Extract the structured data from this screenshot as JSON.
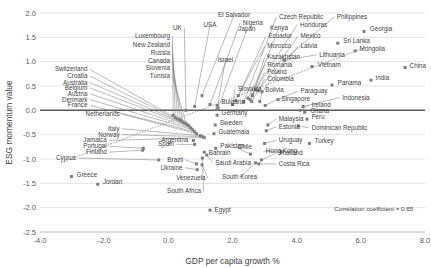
{
  "chart_data": {
    "type": "scatter",
    "title": "",
    "xlabel": "GDP per capita growth %",
    "ylabel": "ESG momentum value",
    "xlim": [
      -4.0,
      8.0
    ],
    "ylim": [
      -2.5,
      2.0
    ],
    "xticks": [
      "-4.0",
      "-2.0",
      "0.0",
      "2.0",
      "4.0",
      "6.0",
      "8.0"
    ],
    "xtick_values": [
      -4.0,
      -2.0,
      0.0,
      2.0,
      4.0,
      6.0,
      8.0
    ],
    "yticks": [
      "2.0",
      "1.5",
      "1.0",
      "0.5",
      "0.0",
      "-0.5",
      "-1.0",
      "-1.5",
      "-2.0",
      "-2.5"
    ],
    "ytick_values": [
      2.0,
      1.5,
      1.0,
      0.5,
      0.0,
      -0.5,
      -1.0,
      -1.5,
      -2.0,
      -2.5
    ],
    "grid": true,
    "legend": "none",
    "annotations": [
      {
        "text": "Correlation  coefficient = 0.65",
        "x": 6.4,
        "y": -2.07
      }
    ],
    "trendline": {
      "visible": true,
      "style": "dotted",
      "x0": -3.35,
      "y0": -1.08,
      "x1": 6.25,
      "y1": 1.32
    },
    "marker_color": "#808080",
    "points": [
      {
        "name": "El Salvador",
        "x": 1.05,
        "y": 0.3,
        "lx": 2.05,
        "ly": 1.92,
        "anchor": "middle"
      },
      {
        "name": "USA",
        "x": 0.82,
        "y": 0.08,
        "lx": 1.3,
        "ly": 1.72,
        "anchor": "middle"
      },
      {
        "name": "Nigeria",
        "x": 1.3,
        "y": 0.12,
        "lx": 2.32,
        "ly": 1.76,
        "anchor": "start"
      },
      {
        "name": "UK",
        "x": 0.55,
        "y": 0.0,
        "lx": 0.42,
        "ly": 1.66,
        "anchor": "end"
      },
      {
        "name": "Japan",
        "x": 1.55,
        "y": 0.05,
        "lx": 2.45,
        "ly": 1.62,
        "anchor": "middle"
      },
      {
        "name": "Czech Republic",
        "x": 2.35,
        "y": 0.18,
        "lx": 3.45,
        "ly": 1.88,
        "anchor": "start"
      },
      {
        "name": "Kenya",
        "x": 2.62,
        "y": 0.32,
        "lx": 3.45,
        "ly": 1.66,
        "anchor": "middle"
      },
      {
        "name": "Honduras",
        "x": 2.72,
        "y": 0.42,
        "lx": 4.1,
        "ly": 1.72,
        "anchor": "start"
      },
      {
        "name": "Philippines",
        "x": 3.6,
        "y": 1.03,
        "lx": 5.25,
        "ly": 1.88,
        "anchor": "start"
      },
      {
        "name": "Georgia",
        "x": 6.1,
        "y": 1.62,
        "lx": 6.28,
        "ly": 1.62,
        "anchor": "start"
      },
      {
        "name": "Luxembourg",
        "x": 0.15,
        "y": -0.1,
        "lx": 0.05,
        "ly": 1.48,
        "anchor": "end"
      },
      {
        "name": "Ecuador",
        "x": 2.18,
        "y": 0.3,
        "lx": 3.12,
        "ly": 1.48,
        "anchor": "start"
      },
      {
        "name": "Mexico",
        "x": 2.8,
        "y": 0.4,
        "lx": 4.12,
        "ly": 1.48,
        "anchor": "start"
      },
      {
        "name": "Sri Lanka",
        "x": 5.28,
        "y": 1.38,
        "lx": 5.45,
        "ly": 1.38,
        "anchor": "start"
      },
      {
        "name": "New Zealand",
        "x": 0.22,
        "y": -0.15,
        "lx": 0.05,
        "ly": 1.3,
        "anchor": "end"
      },
      {
        "name": "Morocco",
        "x": 2.1,
        "y": 0.2,
        "lx": 3.08,
        "ly": 1.28,
        "anchor": "start"
      },
      {
        "name": "Latvia",
        "x": 2.92,
        "y": 0.38,
        "lx": 4.12,
        "ly": 1.28,
        "anchor": "start"
      },
      {
        "name": "Lithuania",
        "x": 3.62,
        "y": 1.03,
        "lx": 4.7,
        "ly": 1.1,
        "anchor": "start"
      },
      {
        "name": "Mongolia",
        "x": 5.82,
        "y": 1.22,
        "lx": 5.96,
        "ly": 1.22,
        "anchor": "start"
      },
      {
        "name": "Russia",
        "x": 0.3,
        "y": -0.18,
        "lx": 0.05,
        "ly": 1.14,
        "anchor": "end"
      },
      {
        "name": "Kazakhstan",
        "x": 2.62,
        "y": 0.3,
        "lx": 3.08,
        "ly": 1.05,
        "anchor": "start"
      },
      {
        "name": "Israel",
        "x": 1.52,
        "y": 0.02,
        "lx": 1.78,
        "ly": 1.0,
        "anchor": "middle"
      },
      {
        "name": "Romania",
        "x": 2.48,
        "y": 0.25,
        "lx": 3.08,
        "ly": 0.89,
        "anchor": "start"
      },
      {
        "name": "Vietnam",
        "x": 4.48,
        "y": 0.9,
        "lx": 4.66,
        "ly": 0.9,
        "anchor": "start"
      },
      {
        "name": "China",
        "x": 7.38,
        "y": 0.88,
        "lx": 7.52,
        "ly": 0.88,
        "anchor": "start"
      },
      {
        "name": "Canada",
        "x": 0.38,
        "y": -0.2,
        "lx": 0.05,
        "ly": 0.98,
        "anchor": "end"
      },
      {
        "name": "Switzerland",
        "x": 0.4,
        "y": -0.22,
        "lx": -2.52,
        "ly": 0.8,
        "anchor": "end"
      },
      {
        "name": "Slovenia",
        "x": 0.46,
        "y": -0.24,
        "lx": 0.05,
        "ly": 0.82,
        "anchor": "end"
      },
      {
        "name": "Poland",
        "x": 2.55,
        "y": 0.22,
        "lx": 3.08,
        "ly": 0.74,
        "anchor": "start"
      },
      {
        "name": "Croatia",
        "x": 0.5,
        "y": -0.26,
        "lx": -2.52,
        "ly": 0.66,
        "anchor": "end"
      },
      {
        "name": "Tunisia",
        "x": 0.56,
        "y": -0.28,
        "lx": 0.05,
        "ly": 0.66,
        "anchor": "end"
      },
      {
        "name": "Colombia",
        "x": 2.6,
        "y": 0.18,
        "lx": 3.08,
        "ly": 0.6,
        "anchor": "start"
      },
      {
        "name": "India",
        "x": 6.32,
        "y": 0.62,
        "lx": 6.46,
        "ly": 0.62,
        "anchor": "start"
      },
      {
        "name": "Australia",
        "x": 0.6,
        "y": -0.3,
        "lx": -2.52,
        "ly": 0.53,
        "anchor": "end"
      },
      {
        "name": "Belgium",
        "x": 0.64,
        "y": -0.32,
        "lx": -2.52,
        "ly": 0.42,
        "anchor": "end"
      },
      {
        "name": "Slovakia",
        "x": 2.0,
        "y": 0.12,
        "lx": 2.16,
        "ly": 0.4,
        "anchor": "start"
      },
      {
        "name": "Bolivia",
        "x": 2.85,
        "y": 0.18,
        "lx": 3.02,
        "ly": 0.38,
        "anchor": "start"
      },
      {
        "name": "Paraguay",
        "x": 3.42,
        "y": 0.22,
        "lx": 4.12,
        "ly": 0.36,
        "anchor": "start"
      },
      {
        "name": "Panama",
        "x": 5.1,
        "y": 0.52,
        "lx": 5.28,
        "ly": 0.52,
        "anchor": "start"
      },
      {
        "name": "Austria",
        "x": 0.7,
        "y": -0.36,
        "lx": -2.52,
        "ly": 0.3,
        "anchor": "end"
      },
      {
        "name": "Singapore",
        "x": 3.02,
        "y": 0.1,
        "lx": 3.52,
        "ly": 0.2,
        "anchor": "start"
      },
      {
        "name": "Indonesia",
        "x": 4.2,
        "y": 0.08,
        "lx": 5.42,
        "ly": 0.22,
        "anchor": "start"
      },
      {
        "name": "Denmark",
        "x": 0.76,
        "y": -0.4,
        "lx": -2.52,
        "ly": 0.18,
        "anchor": "end"
      },
      {
        "name": "Bulgaria",
        "x": 1.52,
        "y": 0.1,
        "lx": 1.66,
        "ly": 0.12,
        "anchor": "start"
      },
      {
        "name": "Ireland",
        "x": 4.1,
        "y": 0.0,
        "lx": 4.46,
        "ly": 0.06,
        "anchor": "start"
      },
      {
        "name": "France",
        "x": 0.82,
        "y": -0.44,
        "lx": -2.52,
        "ly": 0.06,
        "anchor": "end"
      },
      {
        "name": "Netherlands",
        "x": 0.88,
        "y": -0.48,
        "lx": -1.52,
        "ly": -0.12,
        "anchor": "end"
      },
      {
        "name": "Germany",
        "x": 1.52,
        "y": -0.1,
        "lx": 1.66,
        "ly": -0.1,
        "anchor": "start"
      },
      {
        "name": "Ghana",
        "x": 4.25,
        "y": -0.04,
        "lx": 4.42,
        "ly": -0.06,
        "anchor": "start"
      },
      {
        "name": "Peru",
        "x": 4.32,
        "y": -0.18,
        "lx": 4.46,
        "ly": -0.18,
        "anchor": "start"
      },
      {
        "name": "Malaysia",
        "x": 3.1,
        "y": -0.3,
        "lx": 3.44,
        "ly": -0.22,
        "anchor": "start"
      },
      {
        "name": "Italy",
        "x": 1.0,
        "y": -0.52,
        "lx": -1.52,
        "ly": -0.42,
        "anchor": "end"
      },
      {
        "name": "Sweden",
        "x": 1.46,
        "y": -0.3,
        "lx": 1.6,
        "ly": -0.3,
        "anchor": "start"
      },
      {
        "name": "Estonia",
        "x": 3.05,
        "y": -0.42,
        "lx": 3.44,
        "ly": -0.38,
        "anchor": "start"
      },
      {
        "name": "Dominican Republic",
        "x": 4.05,
        "y": -0.32,
        "lx": 4.46,
        "ly": -0.4,
        "anchor": "start"
      },
      {
        "name": "Norway",
        "x": 1.06,
        "y": -0.54,
        "lx": -1.52,
        "ly": -0.54,
        "anchor": "end"
      },
      {
        "name": "Guatemala",
        "x": 1.42,
        "y": -0.48,
        "lx": 1.56,
        "ly": -0.48,
        "anchor": "start"
      },
      {
        "name": "Jamaica",
        "x": 1.12,
        "y": -0.56,
        "lx": -1.92,
        "ly": -0.66,
        "anchor": "end"
      },
      {
        "name": "Argentina",
        "x": 0.78,
        "y": -0.62,
        "lx": 0.62,
        "ly": -0.66,
        "anchor": "end"
      },
      {
        "name": "Uruguay",
        "x": 3.0,
        "y": -0.68,
        "lx": 3.44,
        "ly": -0.66,
        "anchor": "start"
      },
      {
        "name": "Turkey",
        "x": 4.4,
        "y": -0.68,
        "lx": 4.56,
        "ly": -0.68,
        "anchor": "start"
      },
      {
        "name": "Portugal",
        "x": -0.78,
        "y": -0.78,
        "lx": -1.92,
        "ly": -0.78,
        "anchor": "end"
      },
      {
        "name": "Pakistan",
        "x": 1.48,
        "y": -0.78,
        "lx": 1.62,
        "ly": -0.78,
        "anchor": "start"
      },
      {
        "name": "Chile",
        "x": 2.56,
        "y": -0.9,
        "lx": 2.16,
        "ly": -0.8,
        "anchor": "start"
      },
      {
        "name": "Spain",
        "x": 0.82,
        "y": -0.7,
        "lx": 0.18,
        "ly": -0.74,
        "anchor": "end"
      },
      {
        "name": "Finland",
        "x": -0.8,
        "y": -0.82,
        "lx": -1.92,
        "ly": -0.9,
        "anchor": "end"
      },
      {
        "name": "Bahrain",
        "x": 1.12,
        "y": -0.86,
        "lx": 1.26,
        "ly": -0.92,
        "anchor": "start"
      },
      {
        "name": "Thailand",
        "x": 2.9,
        "y": -1.02,
        "lx": 3.44,
        "ly": -0.92,
        "anchor": "start"
      },
      {
        "name": "Hong Kong",
        "x": 3.52,
        "y": -0.86,
        "lx": 3.04,
        "ly": -0.88,
        "anchor": "start"
      },
      {
        "name": "Cyprus",
        "x": -0.3,
        "y": -1.02,
        "lx": -2.88,
        "ly": -1.02,
        "anchor": "end"
      },
      {
        "name": "Brazil",
        "x": 0.88,
        "y": -1.1,
        "lx": 0.46,
        "ly": -1.06,
        "anchor": "end"
      },
      {
        "name": "Saudi Arabia",
        "x": 1.2,
        "y": -0.92,
        "lx": 1.46,
        "ly": -1.12,
        "anchor": "start"
      },
      {
        "name": "Costa Rica",
        "x": 2.82,
        "y": -1.1,
        "lx": 3.44,
        "ly": -1.14,
        "anchor": "start"
      },
      {
        "name": "Ukraine",
        "x": 0.9,
        "y": -1.22,
        "lx": 0.44,
        "ly": -1.22,
        "anchor": "end"
      },
      {
        "name": "South Korea",
        "x": 2.72,
        "y": -1.08,
        "lx": 2.22,
        "ly": -1.42,
        "anchor": "middle"
      },
      {
        "name": "Greece",
        "x": -3.02,
        "y": -1.36,
        "lx": -2.86,
        "ly": -1.36,
        "anchor": "start"
      },
      {
        "name": "Venezuela",
        "x": 1.05,
        "y": -1.12,
        "lx": 1.16,
        "ly": -1.44,
        "anchor": "end"
      },
      {
        "name": "Jordan",
        "x": -2.2,
        "y": -1.52,
        "lx": -2.04,
        "ly": -1.52,
        "anchor": "start"
      },
      {
        "name": "South Africa",
        "x": 1.06,
        "y": -0.98,
        "lx": 1.02,
        "ly": -1.7,
        "anchor": "end"
      },
      {
        "name": "Egypt",
        "x": 1.3,
        "y": -2.05,
        "lx": 1.44,
        "ly": -2.08,
        "anchor": "start"
      }
    ]
  }
}
